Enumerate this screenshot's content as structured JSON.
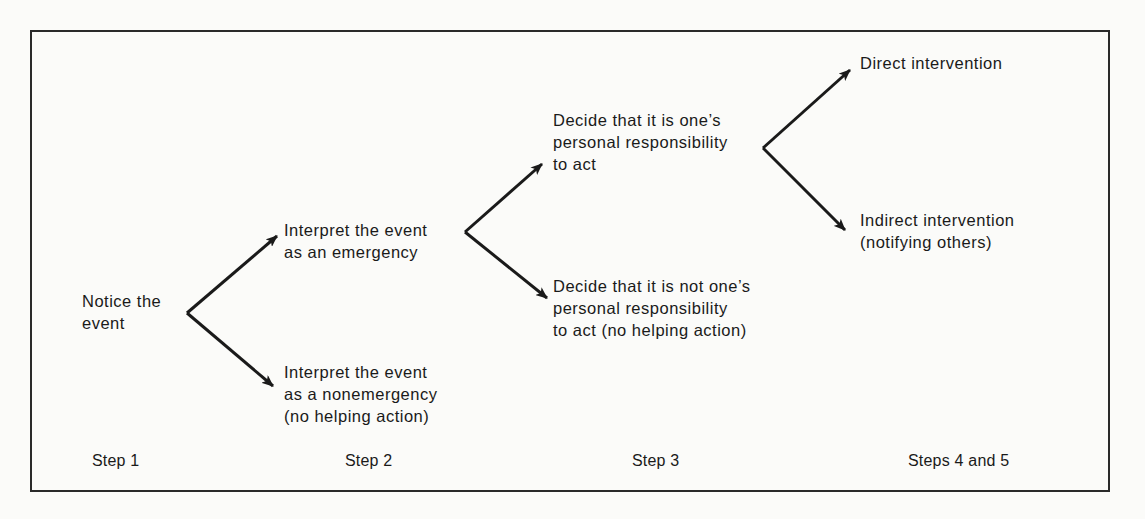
{
  "diagram": {
    "type": "decision-tree",
    "nodes": {
      "notice": {
        "lines": [
          "Notice the",
          "event"
        ]
      },
      "emergency": {
        "lines": [
          "Interpret the event",
          "as an emergency"
        ]
      },
      "nonemergency": {
        "lines": [
          "Interpret the event",
          "as a nonemergency",
          "(no helping action)"
        ]
      },
      "responsible": {
        "lines": [
          "Decide that it is one’s",
          "personal responsibility",
          "to act"
        ]
      },
      "not_responsible": {
        "lines": [
          "Decide that it is not one’s",
          "personal responsibility",
          "to act (no helping action)"
        ]
      },
      "direct": {
        "lines": [
          "Direct intervention"
        ]
      },
      "indirect": {
        "lines": [
          "Indirect intervention",
          "(notifying others)"
        ]
      }
    },
    "edges": [
      {
        "from": "notice",
        "to": "emergency"
      },
      {
        "from": "notice",
        "to": "nonemergency"
      },
      {
        "from": "emergency",
        "to": "responsible"
      },
      {
        "from": "emergency",
        "to": "not_responsible"
      },
      {
        "from": "responsible",
        "to": "direct"
      },
      {
        "from": "responsible",
        "to": "indirect"
      }
    ],
    "steps": [
      "Step 1",
      "Step 2",
      "Step 3",
      "Steps 4 and 5"
    ],
    "colors": {
      "line": "#1a1a1a",
      "border": "#2a2a2a",
      "background": "#fbfbf9"
    }
  }
}
